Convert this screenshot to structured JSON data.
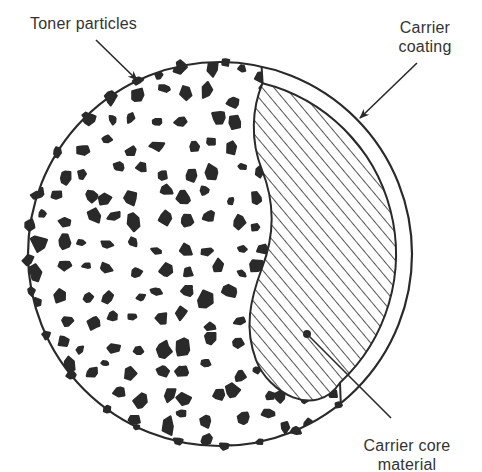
{
  "diagram": {
    "labels": {
      "toner_particles": "Toner particles",
      "carrier_coating_line1": "Carrier",
      "carrier_coating_line2": "coating",
      "carrier_core_line1": "Carrier core",
      "carrier_core_line2": "material"
    },
    "regions": [
      {
        "name": "toner-particle-field",
        "fill": "speckled black particles on white"
      },
      {
        "name": "carrier-coating",
        "fill": "white ring band"
      },
      {
        "name": "carrier-core",
        "fill": "diagonal hatching"
      }
    ],
    "colors": {
      "ink": "#2a2a2a",
      "background": "#ffffff",
      "text": "#333333"
    }
  }
}
